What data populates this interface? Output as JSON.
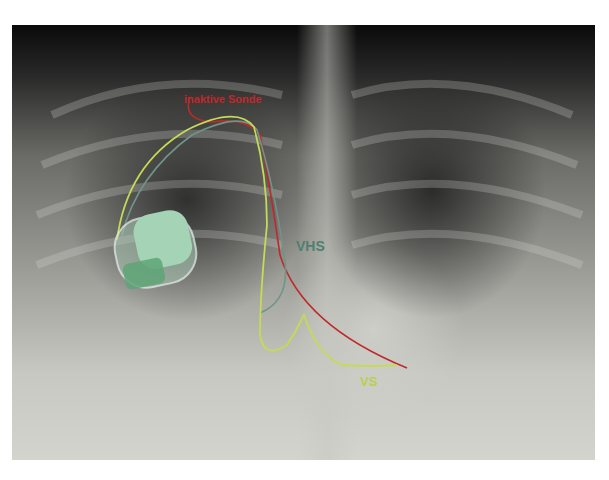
{
  "image": {
    "description": "Chest X-ray with implanted pacemaker and annotated leads",
    "labels": {
      "inactive_lead": "inaktive Sonde",
      "atrial_lead": "VHS",
      "ventricular_lead": "VS"
    },
    "colors": {
      "inactive_lead": "#c0282a",
      "atrial_lead": "#4f7f72",
      "ventricular_lead": "#b8d04a",
      "device": "#9ccfae"
    }
  }
}
